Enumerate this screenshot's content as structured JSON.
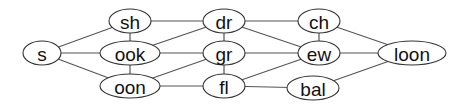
{
  "diagram": {
    "type": "undirected-graph",
    "nodes": [
      {
        "id": "s",
        "label": "s",
        "cx": 42,
        "cy": 53,
        "rx": 19,
        "ry": 12
      },
      {
        "id": "sh",
        "label": "sh",
        "cx": 130,
        "cy": 21,
        "rx": 21,
        "ry": 12
      },
      {
        "id": "ook",
        "label": "ook",
        "cx": 130,
        "cy": 53,
        "rx": 30,
        "ry": 12
      },
      {
        "id": "oon",
        "label": "oon",
        "cx": 130,
        "cy": 86,
        "rx": 30,
        "ry": 12
      },
      {
        "id": "dr",
        "label": "dr",
        "cx": 224,
        "cy": 21,
        "rx": 21,
        "ry": 12
      },
      {
        "id": "gr",
        "label": "gr",
        "cx": 224,
        "cy": 53,
        "rx": 21,
        "ry": 12
      },
      {
        "id": "fl",
        "label": "fl",
        "cx": 224,
        "cy": 86,
        "rx": 21,
        "ry": 12
      },
      {
        "id": "ch",
        "label": "ch",
        "cx": 319,
        "cy": 21,
        "rx": 21,
        "ry": 12
      },
      {
        "id": "ew",
        "label": "ew",
        "cx": 319,
        "cy": 53,
        "rx": 21,
        "ry": 12
      },
      {
        "id": "bal",
        "label": "bal",
        "cx": 313,
        "cy": 88,
        "rx": 26,
        "ry": 12
      },
      {
        "id": "loon",
        "label": "loon",
        "cx": 412,
        "cy": 53,
        "rx": 34,
        "ry": 12
      }
    ],
    "edges": [
      [
        "s",
        "sh"
      ],
      [
        "s",
        "ook"
      ],
      [
        "s",
        "oon"
      ],
      [
        "sh",
        "ook"
      ],
      [
        "sh",
        "dr"
      ],
      [
        "ook",
        "oon"
      ],
      [
        "ook",
        "dr"
      ],
      [
        "ook",
        "gr"
      ],
      [
        "oon",
        "gr"
      ],
      [
        "oon",
        "fl"
      ],
      [
        "dr",
        "gr"
      ],
      [
        "dr",
        "ch"
      ],
      [
        "dr",
        "ew"
      ],
      [
        "gr",
        "fl"
      ],
      [
        "gr",
        "ew"
      ],
      [
        "fl",
        "ew"
      ],
      [
        "fl",
        "bal"
      ],
      [
        "ch",
        "ew"
      ],
      [
        "ch",
        "loon"
      ],
      [
        "ew",
        "loon"
      ],
      [
        "bal",
        "loon"
      ]
    ],
    "colors": {
      "edge": "#555555",
      "node_stroke": "#333333",
      "node_fill": "#ffffff",
      "label": "#111111"
    }
  }
}
